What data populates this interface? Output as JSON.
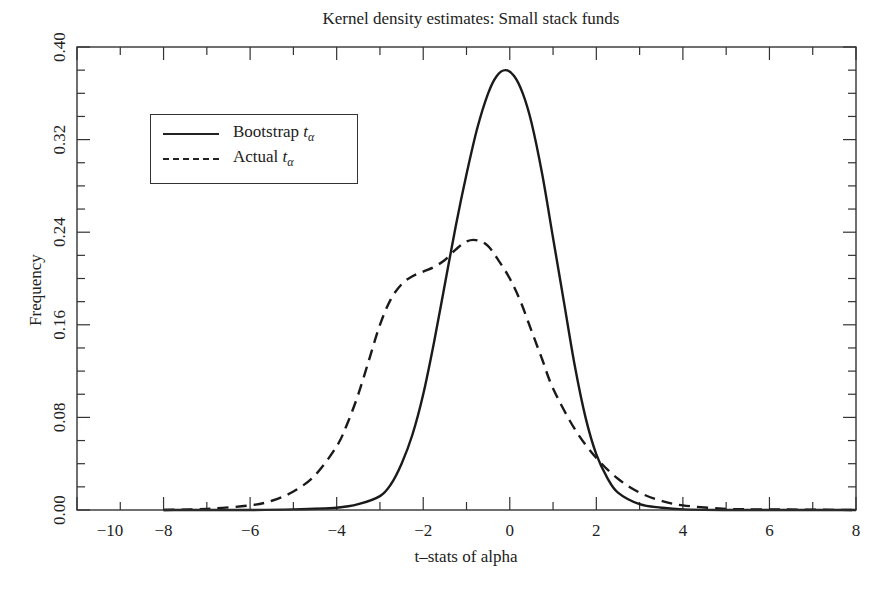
{
  "chart_data": {
    "type": "line",
    "title": "Kernel density estimates: Small stack funds",
    "xlabel": "t–stats of alpha",
    "ylabel": "Frequency",
    "xlim": [
      -10,
      8
    ],
    "ylim": [
      0.0,
      0.4
    ],
    "xticks": [
      -10,
      -8,
      -6,
      -4,
      -2,
      0,
      2,
      4,
      6,
      8
    ],
    "xtick_labels": [
      "−10",
      "−8",
      "−6",
      "−4",
      "−2",
      "0",
      "2",
      "4",
      "6",
      "8"
    ],
    "yticks": [
      0.0,
      0.08,
      0.16,
      0.24,
      0.32,
      0.4
    ],
    "ytick_labels": [
      "0.00",
      "0.08",
      "0.16",
      "0.24",
      "0.32",
      "0.40"
    ],
    "grid": false,
    "legend_position": "upper left",
    "series": [
      {
        "name": "Bootstrap t_alpha",
        "style": "solid",
        "x": [
          -8,
          -6,
          -5,
          -4,
          -3.5,
          -3,
          -2.75,
          -2.5,
          -2.25,
          -2,
          -1.75,
          -1.5,
          -1.25,
          -1,
          -0.75,
          -0.5,
          -0.3,
          -0.1,
          0.1,
          0.3,
          0.5,
          0.75,
          1,
          1.25,
          1.5,
          1.75,
          2,
          2.25,
          2.5,
          3,
          3.5,
          4,
          5,
          6,
          8
        ],
        "y": [
          0.0,
          0.0,
          0.0005,
          0.002,
          0.005,
          0.012,
          0.022,
          0.04,
          0.065,
          0.1,
          0.145,
          0.195,
          0.245,
          0.29,
          0.33,
          0.36,
          0.375,
          0.38,
          0.375,
          0.36,
          0.335,
          0.29,
          0.235,
          0.18,
          0.125,
          0.08,
          0.048,
          0.028,
          0.015,
          0.005,
          0.002,
          0.0005,
          0.0,
          0.0,
          0.0
        ]
      },
      {
        "name": "Actual t_alpha",
        "style": "dashed",
        "x": [
          -8,
          -7,
          -6,
          -5.5,
          -5,
          -4.5,
          -4,
          -3.75,
          -3.5,
          -3.25,
          -3,
          -2.75,
          -2.5,
          -2.25,
          -2,
          -1.75,
          -1.5,
          -1.25,
          -1,
          -0.75,
          -0.5,
          -0.25,
          0,
          0.25,
          0.5,
          0.75,
          1,
          1.5,
          2,
          2.5,
          3,
          3.5,
          4,
          5,
          6,
          8
        ],
        "y": [
          0.0,
          0.001,
          0.004,
          0.008,
          0.016,
          0.03,
          0.055,
          0.075,
          0.1,
          0.13,
          0.16,
          0.182,
          0.195,
          0.202,
          0.206,
          0.21,
          0.216,
          0.225,
          0.232,
          0.233,
          0.228,
          0.215,
          0.2,
          0.18,
          0.155,
          0.13,
          0.105,
          0.07,
          0.045,
          0.027,
          0.015,
          0.008,
          0.004,
          0.001,
          0.0005,
          0.0
        ]
      }
    ]
  },
  "legend": {
    "items": [
      {
        "label": "Bootstrap ",
        "sub": "t",
        "subscript": "α"
      },
      {
        "label": "Actual ",
        "sub": "t",
        "subscript": "α"
      }
    ]
  }
}
